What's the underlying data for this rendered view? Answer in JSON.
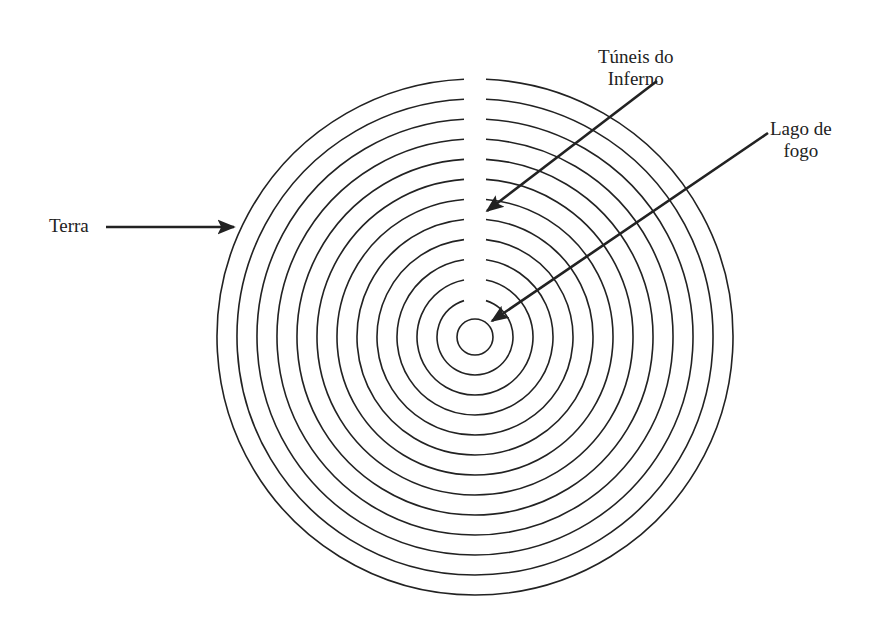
{
  "diagram": {
    "title": "",
    "center": {
      "x": 475,
      "y": 337
    },
    "inner_circle_radius": 18,
    "ring_radii": [
      38,
      58,
      78,
      98,
      118,
      138,
      158,
      178,
      198,
      218,
      238,
      258
    ],
    "ring_gap_half_width_px": 11,
    "stroke_color": "#222222",
    "background_color": "#ffffff",
    "labels": {
      "tunnels": {
        "line1": "Túneis do",
        "line2": "Inferno"
      },
      "lake": {
        "line1": "Lago de",
        "line2": "fogo"
      },
      "earth": {
        "line1": "Terra"
      }
    },
    "arrows": [
      {
        "name": "tunnels-arrow",
        "from": [
          657,
          81
        ],
        "to": [
          487,
          211
        ]
      },
      {
        "name": "lake-arrow",
        "from": [
          768,
          133
        ],
        "to": [
          492,
          321
        ]
      },
      {
        "name": "earth-arrow",
        "from": [
          106,
          227
        ],
        "to": [
          234,
          227
        ]
      }
    ]
  }
}
